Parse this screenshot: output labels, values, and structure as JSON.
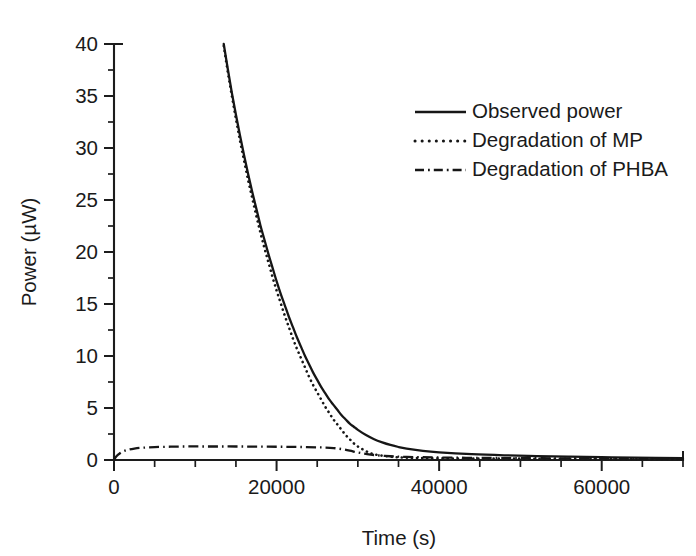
{
  "chart_data": {
    "type": "line",
    "title": "",
    "xlabel": "Time (s)",
    "ylabel": "Power (µW)",
    "xlim": [
      0,
      70000
    ],
    "ylim": [
      0,
      40
    ],
    "xticks": [
      0,
      20000,
      40000,
      60000
    ],
    "xtick_labels": [
      "0",
      "20000",
      "40000",
      "60000"
    ],
    "xminor_step": 5000,
    "yticks": [
      0,
      5,
      10,
      15,
      20,
      25,
      30,
      35,
      40
    ],
    "ytick_labels": [
      "0",
      "5",
      "10",
      "15",
      "20",
      "25",
      "30",
      "35",
      "40"
    ],
    "yminor_step": 2.5,
    "grid": false,
    "legend_position": "upper right",
    "series": [
      {
        "name": "Observed power",
        "style": "solid",
        "x": [
          13500,
          14000,
          14500,
          15000,
          15500,
          16000,
          16500,
          17000,
          17500,
          18000,
          18500,
          19000,
          19500,
          20000,
          20500,
          21000,
          21500,
          22000,
          22500,
          23000,
          23500,
          24000,
          24500,
          25000,
          25500,
          26000,
          26500,
          27000,
          27500,
          28000,
          28500,
          29000,
          29500,
          30000,
          31000,
          32000,
          33000,
          34000,
          35000,
          36000,
          38000,
          40000,
          44000,
          48000,
          52000,
          56000,
          60000,
          64000,
          70000
        ],
        "y": [
          40.0,
          37.6,
          35.3,
          33.2,
          31.2,
          29.3,
          27.5,
          25.8,
          24.2,
          22.6,
          21.2,
          19.8,
          18.5,
          17.2,
          16.0,
          14.9,
          13.8,
          12.8,
          11.8,
          10.9,
          10.0,
          9.2,
          8.4,
          7.7,
          7.0,
          6.4,
          5.8,
          5.3,
          4.8,
          4.3,
          3.9,
          3.5,
          3.2,
          2.9,
          2.4,
          2.0,
          1.7,
          1.45,
          1.25,
          1.1,
          0.88,
          0.74,
          0.56,
          0.45,
          0.38,
          0.32,
          0.27,
          0.23,
          0.18
        ]
      },
      {
        "name": "Degradation of MP",
        "style": "dotted",
        "x": [
          13500,
          14000,
          14500,
          15000,
          15500,
          16000,
          16500,
          17000,
          17500,
          18000,
          18500,
          19000,
          19500,
          20000,
          20500,
          21000,
          21500,
          22000,
          22500,
          23000,
          23500,
          24000,
          24500,
          25000,
          25500,
          26000,
          26500,
          27000,
          27500,
          28000,
          28500,
          29000,
          29500,
          30000,
          31000,
          32000,
          34000,
          36000,
          40000,
          45000,
          50000,
          55000,
          60000,
          65000,
          70000
        ],
        "y": [
          39.8,
          37.3,
          35.0,
          32.8,
          30.7,
          28.8,
          26.9,
          25.2,
          23.5,
          21.9,
          20.4,
          19.0,
          17.6,
          16.3,
          15.1,
          13.9,
          12.8,
          11.7,
          10.7,
          9.8,
          8.9,
          8.0,
          7.2,
          6.5,
          5.8,
          5.1,
          4.5,
          3.9,
          3.4,
          2.9,
          2.4,
          2.0,
          1.6,
          1.3,
          0.85,
          0.55,
          0.32,
          0.22,
          0.16,
          0.14,
          0.13,
          0.12,
          0.11,
          0.11,
          0.1
        ]
      },
      {
        "name": "Degradation of PHBA",
        "style": "dashdot",
        "x": [
          0,
          300,
          700,
          1200,
          1800,
          2500,
          3500,
          5000,
          7000,
          9000,
          11000,
          13000,
          15000,
          17000,
          19000,
          21000,
          23000,
          25000,
          26000,
          27000,
          28000,
          29000,
          30000,
          31000,
          32000,
          34000,
          36000,
          40000,
          45000,
          50000,
          55000,
          60000,
          65000,
          70000
        ],
        "y": [
          0.0,
          0.35,
          0.62,
          0.85,
          1.0,
          1.1,
          1.18,
          1.24,
          1.28,
          1.3,
          1.3,
          1.3,
          1.3,
          1.29,
          1.28,
          1.27,
          1.25,
          1.22,
          1.2,
          1.15,
          1.05,
          0.9,
          0.72,
          0.58,
          0.48,
          0.36,
          0.3,
          0.24,
          0.2,
          0.18,
          0.16,
          0.15,
          0.14,
          0.13
        ]
      }
    ],
    "legend": [
      {
        "label": "Observed power",
        "style": "solid"
      },
      {
        "label": "Degradation of MP",
        "style": "dotted"
      },
      {
        "label": "Degradation of PHBA",
        "style": "dashdot"
      }
    ],
    "colors": {
      "ink": "#161616",
      "background": "#ffffff"
    }
  }
}
